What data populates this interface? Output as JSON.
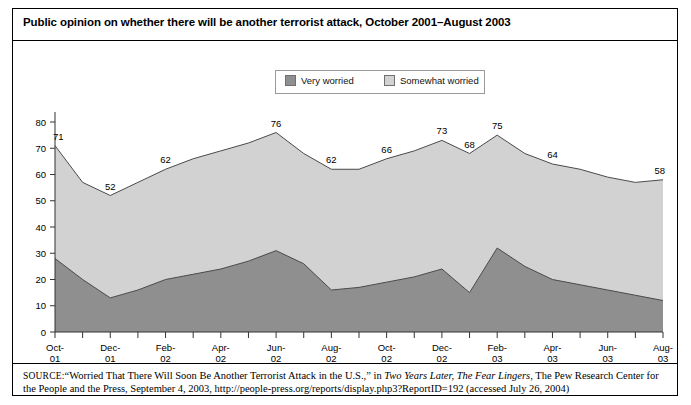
{
  "figure": {
    "title": "Public opinion on whether there will be another terrorist attack, October 2001–August 2003"
  },
  "legend": {
    "position": "top-center",
    "entries": [
      {
        "label": "Very worried",
        "color": "#8f8f8f",
        "icon": "legend-swatch-icon"
      },
      {
        "label": "Somewhat worried",
        "color": "#d2d2d2",
        "icon": "legend-swatch-icon"
      }
    ]
  },
  "source": {
    "label": "SOURCE:",
    "part1": "“Worried That There Will Soon Be Another Terrorist Attack in the U.S.,” in ",
    "italic1": "Two Years Later, The Fear Lingers,",
    "part2": " The Pew Research Center for the People and the Press, September 4, 2003, http://people-press.org/reports/display.php3?ReportID=192 (accessed July 26, 2004)"
  },
  "chart_data": {
    "type": "area",
    "stacked": true,
    "title": "Public opinion on whether there will be another terrorist attack, October 2001–August 2003",
    "xlabel": "",
    "ylabel": "",
    "ylim": [
      0,
      80
    ],
    "yticks": [
      0,
      10,
      20,
      30,
      40,
      50,
      60,
      70,
      80
    ],
    "grid": false,
    "legend_position": "top-center",
    "x": [
      "Oct-01",
      "Nov-01",
      "Dec-01",
      "Jan-02",
      "Feb-02",
      "Mar-02",
      "Apr-02",
      "May-02",
      "Jun-02",
      "Jul-02",
      "Aug-02",
      "Sep-02",
      "Oct-02",
      "Nov-02",
      "Dec-02",
      "Jan-03",
      "Feb-03",
      "Mar-03",
      "Apr-03",
      "May-03",
      "Jun-03",
      "Jul-03",
      "Aug-03"
    ],
    "xtick_labels": [
      "Oct-01",
      "Dec-01",
      "Feb-02",
      "Apr-02",
      "Jun-02",
      "Aug-02",
      "Oct-02",
      "Dec-02",
      "Feb-03",
      "Apr-03",
      "Jun-03",
      "Aug-03"
    ],
    "xtick_indices": [
      0,
      2,
      4,
      6,
      8,
      10,
      12,
      14,
      16,
      18,
      20,
      22
    ],
    "series": [
      {
        "name": "Very worried",
        "color": "#8f8f8f",
        "values": [
          28,
          20,
          13,
          16,
          20,
          22,
          24,
          27,
          31,
          26,
          16,
          17,
          19,
          21,
          24,
          15,
          32,
          25,
          20,
          18,
          16,
          14,
          12
        ]
      },
      {
        "name": "Somewhat worried",
        "color": "#d2d2d2",
        "values": [
          43,
          37,
          39,
          41,
          42,
          44,
          45,
          45,
          45,
          42,
          46,
          45,
          47,
          48,
          49,
          53,
          43,
          43,
          44,
          44,
          43,
          43,
          46
        ]
      }
    ],
    "totals": [
      71,
      61,
      52,
      57,
      62,
      66,
      69,
      72,
      76,
      68,
      62,
      62,
      66,
      69,
      73,
      68,
      75,
      68,
      64,
      62,
      59,
      57,
      58
    ],
    "point_labels": [
      {
        "index": 0,
        "value": 71
      },
      {
        "index": 2,
        "value": 52
      },
      {
        "index": 4,
        "value": 62
      },
      {
        "index": 8,
        "value": 76
      },
      {
        "index": 10,
        "value": 62
      },
      {
        "index": 12,
        "value": 66
      },
      {
        "index": 14,
        "value": 73
      },
      {
        "index": 15,
        "value": 68
      },
      {
        "index": 16,
        "value": 75
      },
      {
        "index": 18,
        "value": 64
      },
      {
        "index": 22,
        "value": 58
      }
    ]
  }
}
